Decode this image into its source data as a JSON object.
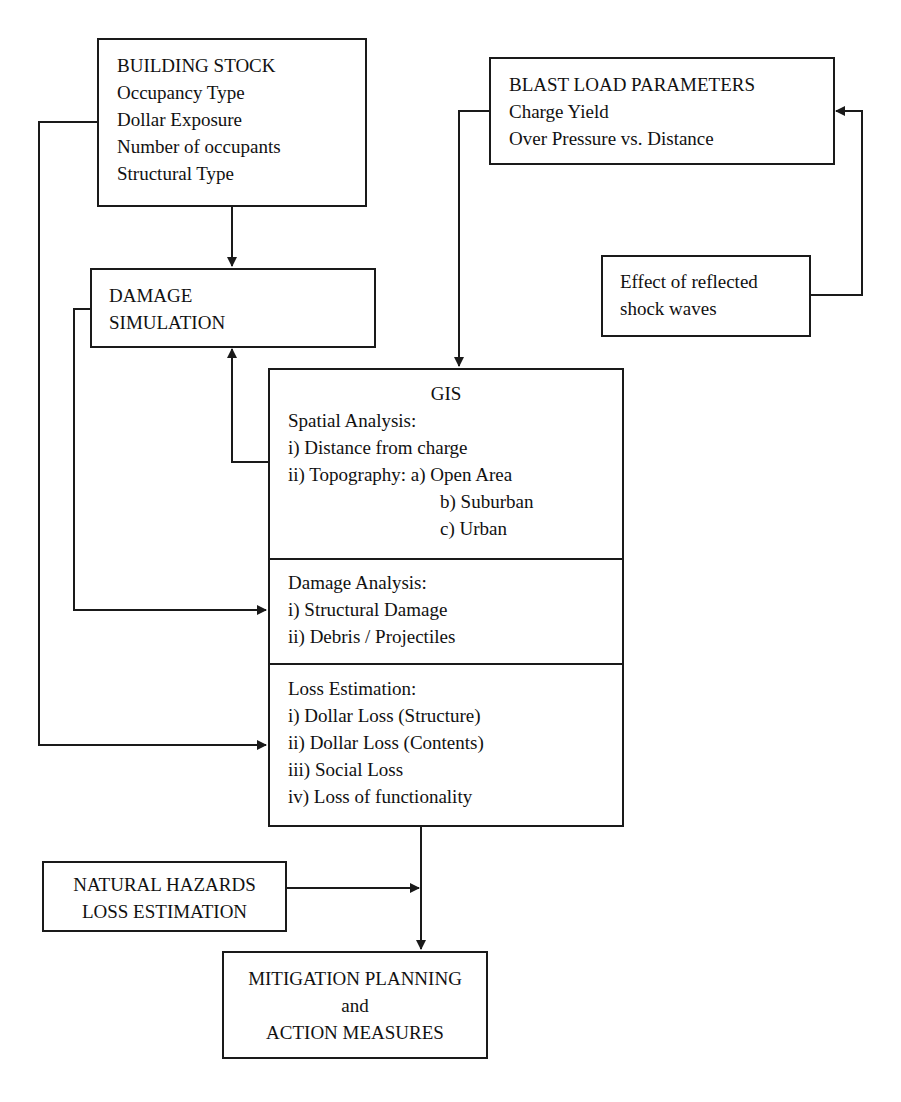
{
  "building_stock": {
    "title": "BUILDING STOCK",
    "items": [
      "Occupancy Type",
      "Dollar Exposure",
      "Number of occupants",
      "Structural Type"
    ]
  },
  "damage_simulation": {
    "lines": [
      "DAMAGE",
      "SIMULATION"
    ]
  },
  "blast_load": {
    "title": "BLAST LOAD PARAMETERS",
    "items": [
      "Charge Yield",
      "Over Pressure vs. Distance"
    ]
  },
  "reflected_waves": {
    "lines": [
      "Effect of reflected",
      "shock waves"
    ]
  },
  "gis": {
    "title": "GIS",
    "spatial": {
      "heading": "Spatial Analysis:",
      "items": [
        "i) Distance from charge",
        "ii) Topography: a) Open Area",
        "b) Suburban",
        "c) Urban"
      ]
    },
    "damage": {
      "heading": "Damage Analysis:",
      "items": [
        "i) Structural Damage",
        "ii) Debris / Projectiles"
      ]
    },
    "loss": {
      "heading": "Loss Estimation:",
      "items": [
        "i) Dollar Loss (Structure)",
        "ii) Dollar Loss (Contents)",
        "iii) Social Loss",
        "iv) Loss of functionality"
      ]
    }
  },
  "natural_hazards": {
    "lines": [
      "NATURAL HAZARDS",
      "LOSS ESTIMATION"
    ]
  },
  "mitigation": {
    "lines": [
      "MITIGATION PLANNING",
      "and",
      "ACTION MEASURES"
    ]
  },
  "colors": {
    "line": "#1a1a1a",
    "background": "#ffffff"
  }
}
